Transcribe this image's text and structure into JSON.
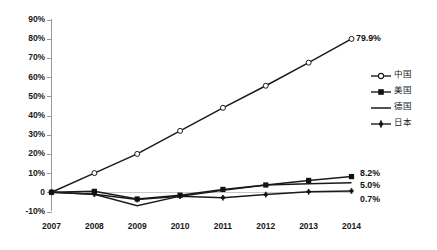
{
  "chart_data": {
    "type": "line",
    "title": "",
    "xlabel": "",
    "ylabel": "",
    "categories": [
      "2007",
      "2008",
      "2009",
      "2010",
      "2011",
      "2012",
      "2013",
      "2014"
    ],
    "x": [
      2007,
      2008,
      2009,
      2010,
      2011,
      2012,
      2013,
      2014
    ],
    "ylim": [
      -10,
      90
    ],
    "ytick_labels": [
      "90%",
      "80%",
      "70%",
      "60%",
      "50%",
      "40%",
      "30%",
      "20%",
      "10%",
      "0",
      "-10%"
    ],
    "ytick_values": [
      90,
      80,
      70,
      60,
      50,
      40,
      30,
      20,
      10,
      0,
      -10
    ],
    "grid": false,
    "legend_position": "right",
    "series": [
      {
        "name": "中国",
        "marker": "open-circle",
        "values": [
          0,
          10.0,
          20.0,
          32.0,
          44.0,
          55.5,
          67.5,
          79.9
        ],
        "end_label": "79.9%"
      },
      {
        "name": "美国",
        "marker": "filled-square",
        "values": [
          0,
          0.5,
          -3.5,
          -1.5,
          1.5,
          3.8,
          6.2,
          8.2
        ],
        "end_label": "8.2%"
      },
      {
        "name": "德国",
        "marker": "none",
        "values": [
          0,
          -1.0,
          -7.0,
          -2.0,
          1.0,
          3.8,
          4.5,
          5.0
        ],
        "end_label": "5.0%"
      },
      {
        "name": "日本",
        "marker": "cross",
        "values": [
          0,
          -1.0,
          -3.8,
          -2.0,
          -2.8,
          -1.2,
          0.3,
          0.7
        ],
        "end_label": "0.7%"
      }
    ],
    "annotations": [
      {
        "text": "79.9%",
        "series": "中国",
        "x": 2014
      },
      {
        "text": "8.2%",
        "series": "美国",
        "x": 2014
      },
      {
        "text": "5.0%",
        "series": "德国",
        "x": 2014
      },
      {
        "text": "0.7%",
        "series": "日本",
        "x": 2014
      }
    ],
    "colors": {
      "line": "#1a1a1a",
      "axis": "#9a9a9a",
      "zero_line": "#c9c9c9",
      "text": "#1a1a1a",
      "background": "#ffffff"
    }
  },
  "legend": {
    "items": [
      {
        "label": "中国"
      },
      {
        "label": "美国"
      },
      {
        "label": "德国"
      },
      {
        "label": "日本"
      }
    ]
  },
  "axis": {
    "y_labels": [
      "90%",
      "80%",
      "70%",
      "60%",
      "50%",
      "40%",
      "30%",
      "20%",
      "10%",
      "0",
      "-10%"
    ],
    "x_labels": [
      "2007",
      "2008",
      "2009",
      "2010",
      "2011",
      "2012",
      "2013",
      "2014"
    ]
  },
  "point_labels": {
    "china": "79.9%",
    "usa": "8.2%",
    "germany": "5.0%",
    "japan": "0.7%"
  }
}
